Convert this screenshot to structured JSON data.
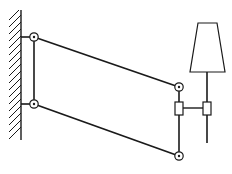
{
  "diagram": {
    "title": "Parallelogram wall-mounted lamp linkage",
    "colors": {
      "stroke": "#1a1a1a",
      "background": "#ffffff",
      "fill": "#ffffff"
    },
    "wall": {
      "x": 21,
      "y1": 10,
      "y2": 140,
      "hatch": true
    },
    "pivots": [
      {
        "id": "top-left",
        "x": 34,
        "y": 37
      },
      {
        "id": "bottom-left",
        "x": 34,
        "y": 104
      },
      {
        "id": "top-right",
        "x": 179,
        "y": 87
      },
      {
        "id": "bottom-right",
        "x": 179,
        "y": 156
      }
    ],
    "links": [
      {
        "id": "top-bar",
        "from": "top-left",
        "to": "top-right"
      },
      {
        "id": "bottom-bar",
        "from": "bottom-left",
        "to": "bottom-right"
      },
      {
        "id": "left-link",
        "from": "top-left",
        "to": "bottom-left"
      },
      {
        "id": "right-link",
        "from": "top-right",
        "to": "bottom-right"
      }
    ],
    "sliders": [
      {
        "id": "slider-right-link",
        "x": 175,
        "y": 102,
        "w": 8,
        "h": 13
      },
      {
        "id": "slider-lamp-pole",
        "x": 203,
        "y": 102,
        "w": 8,
        "h": 13
      }
    ],
    "lamp": {
      "pole": {
        "x": 207,
        "y1": 72,
        "y2": 143
      },
      "shade": {
        "top_left": 198,
        "top_right": 217,
        "top_y": 23,
        "bottom_left": 190,
        "bottom_right": 225,
        "bottom_y": 72
      }
    }
  }
}
